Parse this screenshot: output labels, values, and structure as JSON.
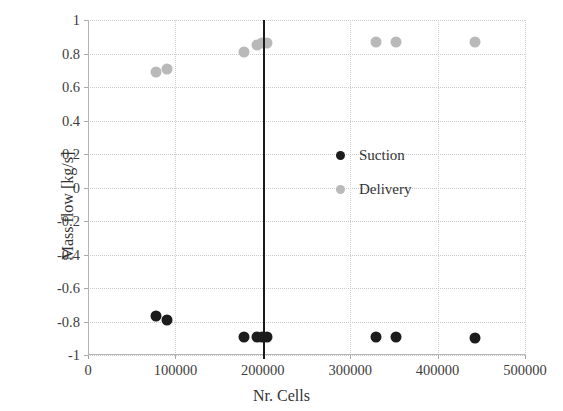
{
  "chart_data": {
    "type": "scatter",
    "title": "",
    "xlabel": "Nr. Cells",
    "ylabel": "Mass flow [kg/s]",
    "xlim": [
      0,
      500000
    ],
    "ylim": [
      -1,
      1
    ],
    "xticks": [
      0,
      100000,
      200000,
      300000,
      400000,
      500000
    ],
    "xtick_labels": [
      "0",
      "100000",
      "200000",
      "300000",
      "400000",
      "500000"
    ],
    "yticks": [
      1,
      0.8,
      0.6,
      0.4,
      0.2,
      0,
      -0.2,
      -0.4,
      -0.6,
      -0.8,
      -1
    ],
    "ytick_labels": [
      "1",
      "0.8",
      "0.6",
      "0.4",
      "0.2",
      "0",
      "-0.2",
      "-0.4",
      "-0.6",
      "-0.8",
      "-1"
    ],
    "grid": true,
    "legend_position": "inside-right",
    "annotations": [
      {
        "name": "selected-mesh-line",
        "type": "vertical-line",
        "x": 200000,
        "color": "#1a1a1a"
      }
    ],
    "series": [
      {
        "name": "Suction",
        "color": "#1c1c1c",
        "marker": "circle",
        "points": [
          {
            "x": 78000,
            "y": -0.77
          },
          {
            "x": 90000,
            "y": -0.79
          },
          {
            "x": 178000,
            "y": -0.89
          },
          {
            "x": 193000,
            "y": -0.89
          },
          {
            "x": 199000,
            "y": -0.89
          },
          {
            "x": 205000,
            "y": -0.89
          },
          {
            "x": 330000,
            "y": -0.89
          },
          {
            "x": 352000,
            "y": -0.89
          },
          {
            "x": 443000,
            "y": -0.9
          }
        ]
      },
      {
        "name": "Delivery",
        "color": "#b9b9b9",
        "marker": "circle",
        "points": [
          {
            "x": 78000,
            "y": 0.69
          },
          {
            "x": 90000,
            "y": 0.71
          },
          {
            "x": 178000,
            "y": 0.81
          },
          {
            "x": 193000,
            "y": 0.85
          },
          {
            "x": 199000,
            "y": 0.86
          },
          {
            "x": 205000,
            "y": 0.86
          },
          {
            "x": 330000,
            "y": 0.87
          },
          {
            "x": 352000,
            "y": 0.87
          },
          {
            "x": 443000,
            "y": 0.87
          }
        ]
      }
    ]
  },
  "legend": {
    "items": [
      {
        "label": "Suction",
        "color": "#1c1c1c"
      },
      {
        "label": "Delivery",
        "color": "#b9b9b9"
      }
    ]
  },
  "axes": {
    "x_title": "Nr. Cells",
    "y_title": "Mass flow [kg/s]"
  }
}
